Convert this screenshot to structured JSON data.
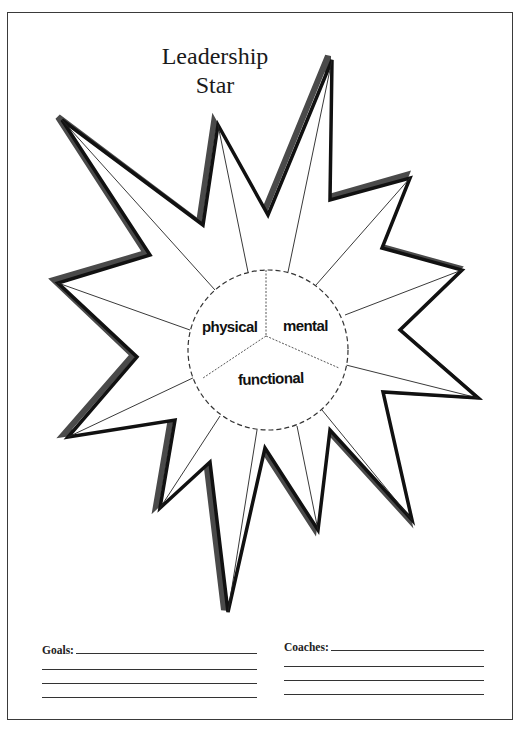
{
  "title": {
    "line1": "Leadership",
    "line2": "Star"
  },
  "star": {
    "center_sections": [
      "physical",
      "mental",
      "functional"
    ],
    "outline_color": "#1a1a1a",
    "shadow_color": "#555555",
    "point_count": 12
  },
  "form": {
    "goals": {
      "label": "Goals:",
      "extra_lines": 3
    },
    "coaches": {
      "label": "Coaches:",
      "extra_lines": 3
    }
  }
}
